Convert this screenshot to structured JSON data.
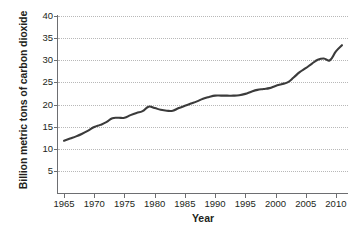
{
  "chart_data": {
    "type": "line",
    "title": "",
    "xlabel": "Year",
    "ylabel": "Billion metric tons of carbon dioxide",
    "xlim": [
      1964,
      2012
    ],
    "ylim": [
      0,
      40
    ],
    "grid": true,
    "legend": "none",
    "x_ticks": [
      "1965",
      "1970",
      "1975",
      "1980",
      "1985",
      "1990",
      "1995",
      "2000",
      "2005",
      "2010"
    ],
    "y_ticks": [
      "5",
      "10",
      "15",
      "20",
      "25",
      "30",
      "35",
      "40"
    ],
    "series": [
      {
        "name": "Global carbon dioxide emissions",
        "color": "#3b3b3b",
        "x": [
          1965,
          1966,
          1967,
          1968,
          1969,
          1970,
          1971,
          1972,
          1973,
          1974,
          1975,
          1976,
          1977,
          1978,
          1979,
          1980,
          1981,
          1982,
          1983,
          1984,
          1985,
          1986,
          1987,
          1988,
          1989,
          1990,
          1991,
          1992,
          1993,
          1994,
          1995,
          1996,
          1997,
          1998,
          1999,
          2000,
          2001,
          2002,
          2003,
          2004,
          2005,
          2006,
          2007,
          2008,
          2009,
          2010,
          2011
        ],
        "values": [
          11.8,
          12.3,
          12.8,
          13.4,
          14.1,
          14.9,
          15.4,
          16.0,
          16.9,
          17.0,
          17.0,
          17.6,
          18.1,
          18.5,
          19.5,
          19.2,
          18.8,
          18.6,
          18.6,
          19.2,
          19.7,
          20.2,
          20.7,
          21.3,
          21.7,
          22.0,
          22.0,
          22.0,
          22.0,
          22.1,
          22.4,
          22.9,
          23.3,
          23.5,
          23.7,
          24.2,
          24.6,
          25.0,
          26.1,
          27.3,
          28.2,
          29.2,
          30.1,
          30.4,
          30.0,
          32.0,
          33.4
        ]
      }
    ]
  }
}
